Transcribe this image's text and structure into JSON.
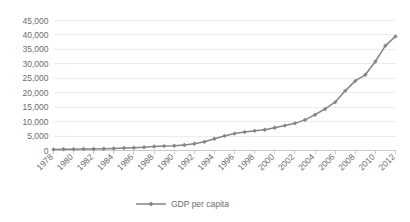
{
  "chart_data": {
    "type": "line",
    "title": "",
    "subtitle": "",
    "xlabel": "",
    "ylabel": "",
    "grid": "horizontal",
    "legend_position": "bottom",
    "ylim": [
      0,
      45000
    ],
    "ytick_values": [
      0,
      5000,
      10000,
      15000,
      20000,
      25000,
      30000,
      35000,
      40000,
      45000
    ],
    "ytick_labels": [
      "0",
      "5,000",
      "10,000",
      "15,000",
      "20,000",
      "25,000",
      "30,000",
      "35,000",
      "40,000",
      "45,000"
    ],
    "x": [
      1978,
      1979,
      1980,
      1981,
      1982,
      1983,
      1984,
      1985,
      1986,
      1987,
      1988,
      1989,
      1990,
      1991,
      1992,
      1993,
      1994,
      1995,
      1996,
      1997,
      1998,
      1999,
      2000,
      2001,
      2002,
      2003,
      2004,
      2005,
      2006,
      2007,
      2008,
      2009,
      2010,
      2011,
      2012
    ],
    "xtick_labels": [
      "1978",
      "1980",
      "1982",
      "1984",
      "1986",
      "1988",
      "1990",
      "1992",
      "1994",
      "1996",
      "1998",
      "2000",
      "2002",
      "2004",
      "2006",
      "2008",
      "2010",
      "2012"
    ],
    "xtick_values": [
      1978,
      1980,
      1982,
      1984,
      1986,
      1988,
      1990,
      1992,
      1994,
      1996,
      1998,
      2000,
      2002,
      2004,
      2006,
      2008,
      2010,
      2012
    ],
    "xtick_rotation_deg": 45,
    "series": [
      {
        "name": "GDP per capita",
        "color": "#858585",
        "marker": "diamond",
        "values": [
          385,
          420,
          470,
          500,
          535,
          585,
          700,
          860,
          960,
          1110,
          1370,
          1530,
          1650,
          1900,
          2320,
          3000,
          4050,
          5050,
          5850,
          6420,
          6800,
          7160,
          7860,
          8620,
          9400,
          10600,
          12400,
          14370,
          16740,
          20640,
          24100,
          26200,
          30800,
          36300,
          39500
        ]
      }
    ]
  },
  "legend": {
    "items": [
      {
        "label": "GDP per capita",
        "color": "#858585"
      }
    ]
  }
}
